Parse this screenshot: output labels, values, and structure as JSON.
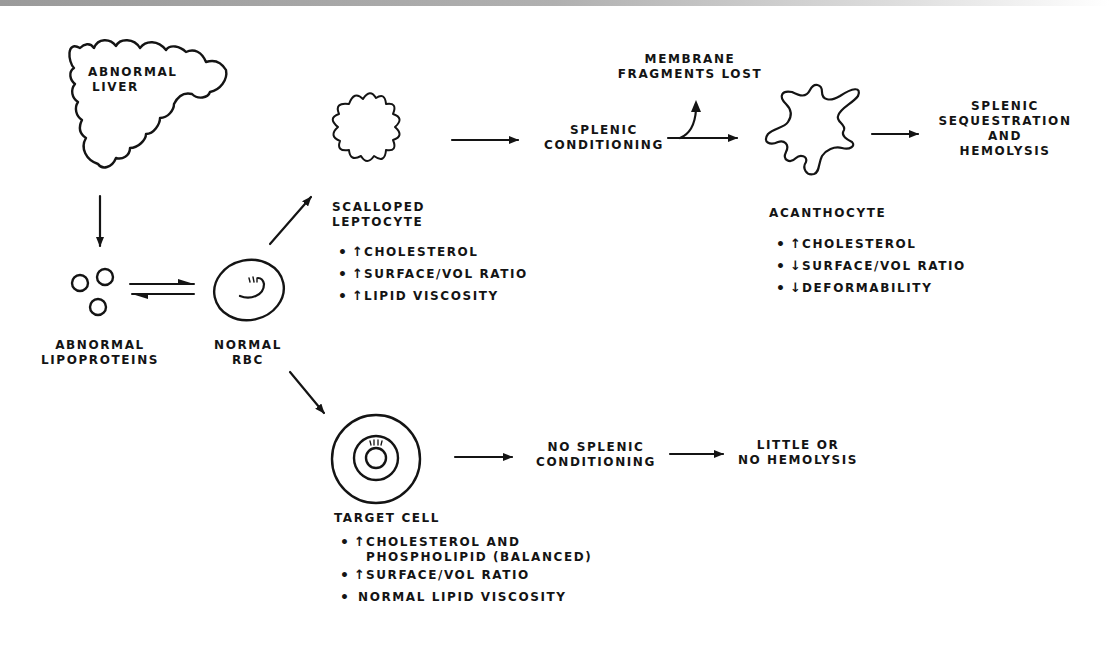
{
  "diagram": {
    "liver": {
      "label_line1": "ABNORMAL",
      "label_line2": "LIVER"
    },
    "lipoproteins": {
      "label_line1": "ABNORMAL",
      "label_line2": "LIPOPROTEINS"
    },
    "normal_rbc": {
      "label_line1": "NORMAL",
      "label_line2": "RBC"
    },
    "leptocyte": {
      "label_line1": "SCALLOPED",
      "label_line2": "LEPTOCYTE",
      "bullets": [
        {
          "dot": "•",
          "direction": "↑",
          "text": "CHOLESTEROL"
        },
        {
          "dot": "•",
          "direction": "↑",
          "text": "SURFACE/VOL RATIO"
        },
        {
          "dot": "•",
          "direction": "↑",
          "text": "LIPID VISCOSITY"
        }
      ]
    },
    "splenic_conditioning": {
      "label_line1": "SPLENIC",
      "label_line2": "CONDITIONING"
    },
    "membrane_fragments": {
      "label_line1": "MEMBRANE",
      "label_line2": "FRAGMENTS LOST"
    },
    "acanthocyte": {
      "label": "ACANTHOCYTE",
      "bullets": [
        {
          "dot": "•",
          "direction": "↑",
          "text": "CHOLESTEROL"
        },
        {
          "dot": "•",
          "direction": "↓",
          "text": "SURFACE/VOL RATIO"
        },
        {
          "dot": "•",
          "direction": "↓",
          "text": "DEFORMABILITY"
        }
      ]
    },
    "splenic_sequestration": {
      "label_line1": "SPLENIC",
      "label_line2": "SEQUESTRATION",
      "label_line3": "AND",
      "label_line4": "HEMOLYSIS"
    },
    "target_cell": {
      "label": "TARGET CELL",
      "bullets": [
        {
          "dot": "•",
          "direction": "↑",
          "text": "CHOLESTEROL AND",
          "continuation": "PHOSPHOLIPID (BALANCED)"
        },
        {
          "dot": "•",
          "direction": "↑",
          "text": "SURFACE/VOL RATIO"
        },
        {
          "dot": "•",
          "direction": "",
          "text": "NORMAL LIPID VISCOSITY"
        }
      ]
    },
    "no_splenic_conditioning": {
      "label_line1": "NO SPLENIC",
      "label_line2": "CONDITIONING"
    },
    "little_hemolysis": {
      "label_line1": "LITTLE OR",
      "label_line2": "NO HEMOLYSIS"
    }
  },
  "colors": {
    "ink": "#141414",
    "background": "#ffffff",
    "top_band": "#9a9a9a"
  }
}
